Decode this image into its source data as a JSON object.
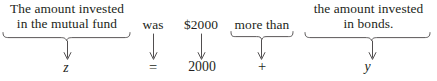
{
  "diagram": {
    "equation": "z = 2000 + y",
    "width": 437,
    "height": 81,
    "ink_color": "#231f20",
    "rule_color": "#3d3a3b",
    "background_color": "#ffffff",
    "groups": [
      {
        "id": "mutual-fund",
        "phrase": "The amount invested\nin the mutual fund",
        "symbol": "z",
        "symbol_kind": "variable",
        "has_brace": true
      },
      {
        "id": "was",
        "phrase": "was",
        "symbol": "=",
        "symbol_kind": "operator",
        "has_brace": false
      },
      {
        "id": "amount",
        "phrase": "$2000",
        "symbol": "2000",
        "symbol_kind": "number",
        "has_brace": false
      },
      {
        "id": "more-than",
        "phrase": "more than",
        "symbol": "+",
        "symbol_kind": "operator",
        "has_brace": true
      },
      {
        "id": "bonds",
        "phrase": "the amount invested\nin bonds.",
        "symbol": "y",
        "symbol_kind": "variable",
        "has_brace": true
      }
    ]
  }
}
